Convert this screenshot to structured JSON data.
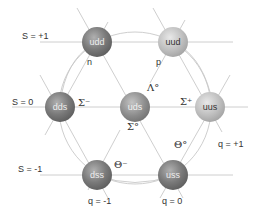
{
  "diagram": {
    "strangeness_labels": [
      {
        "text": "S = +1",
        "x": 22,
        "y": 37
      },
      {
        "text": "S = 0",
        "x": 12,
        "y": 102
      },
      {
        "text": "S = -1",
        "x": 18,
        "y": 170
      }
    ],
    "charge_labels": [
      {
        "text": "q = -1",
        "x": 88,
        "y": 200
      },
      {
        "text": "q = 0",
        "x": 162,
        "y": 200
      },
      {
        "text": "q = +1",
        "x": 218,
        "y": 143
      }
    ],
    "particles": [
      {
        "quarks": "udd",
        "name": "n",
        "shade": "dark",
        "cx": 97,
        "cy": 42,
        "name_x": 87,
        "name_y": 62,
        "greek": false
      },
      {
        "quarks": "uud",
        "name": "p",
        "shade": "light",
        "cx": 173,
        "cy": 42,
        "name_x": 156,
        "name_y": 62,
        "greek": false
      },
      {
        "quarks": "dds",
        "name": "Σ⁻",
        "shade": "dark",
        "cx": 60,
        "cy": 107,
        "name_x": 79,
        "name_y": 101,
        "greek": true
      },
      {
        "quarks": "uds",
        "name": "Λ°",
        "shade": "mid",
        "cx": 135,
        "cy": 107,
        "name_x": 147,
        "name_y": 87,
        "greek": true
      },
      {
        "quarks": "uds",
        "name": "Σ°",
        "shade": "mid",
        "cx": 135,
        "cy": 107,
        "name_x": 128,
        "name_y": 125,
        "greek": true,
        "secondary": true
      },
      {
        "quarks": "uus",
        "name": "Σ⁺",
        "shade": "light",
        "cx": 210,
        "cy": 107,
        "name_x": 181,
        "name_y": 101,
        "greek": true
      },
      {
        "quarks": "dss",
        "name": "Θ⁻",
        "shade": "dark",
        "cx": 97,
        "cy": 175,
        "name_x": 115,
        "name_y": 164,
        "greek": true
      },
      {
        "quarks": "uss",
        "name": "Θ°",
        "shade": "dark",
        "cx": 173,
        "cy": 175,
        "name_x": 175,
        "name_y": 144,
        "greek": true
      }
    ],
    "colors": {
      "line": "#c8c8c8",
      "text": "#333333",
      "background": "#ffffff"
    }
  }
}
